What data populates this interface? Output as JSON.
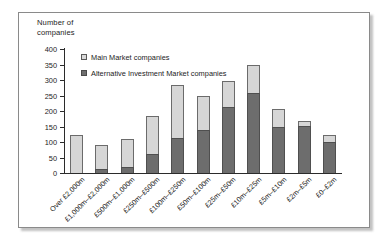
{
  "figure": {
    "axis_title": "Number of\ncompanies",
    "axis_title_line1": "Number of",
    "axis_title_line2": "companies"
  },
  "legend": {
    "position": "inside-top-left",
    "items": [
      {
        "label": "Main Market companies",
        "swatch": "light-gray-square",
        "color": "#d6d6d6"
      },
      {
        "label": "Alternative Investment Market companies",
        "swatch": "dark-gray-square",
        "color": "#6d6d6d"
      }
    ]
  },
  "yaxis": {
    "ticks": [
      "0",
      "50",
      "100",
      "150",
      "200",
      "250",
      "300",
      "350",
      "400"
    ],
    "min": 0,
    "max": 400,
    "step": 50
  },
  "chart_data": {
    "type": "bar",
    "subtype": "stacked",
    "title": "",
    "xlabel": "",
    "ylabel": "Number of companies",
    "ylim": [
      0,
      400
    ],
    "ytick_step": 50,
    "grid": false,
    "legend_position": "inside-top-left",
    "categories": [
      "Over £2,000m",
      "£1,000m–£2,000m",
      "£500m–£1,000m",
      "£250m–£500m",
      "£100m–£250m",
      "£50m–£100m",
      "£25m–£50m",
      "£10m–£25m",
      "£5m–£10m",
      "£2m–£5m",
      "£0–£2m"
    ],
    "series": [
      {
        "name": "Alternative Investment Market companies",
        "color": "#6d6d6d",
        "values": [
          0,
          13,
          21,
          62,
          114,
          139,
          214,
          259,
          148,
          152,
          101
        ]
      },
      {
        "name": "Main Market companies",
        "color": "#d6d6d6",
        "values": [
          123,
          78,
          88,
          121,
          169,
          109,
          82,
          90,
          59,
          15,
          22
        ]
      }
    ],
    "totals": [
      123,
      91,
      109,
      183,
      283,
      248,
      296,
      349,
      207,
      167,
      123
    ]
  }
}
